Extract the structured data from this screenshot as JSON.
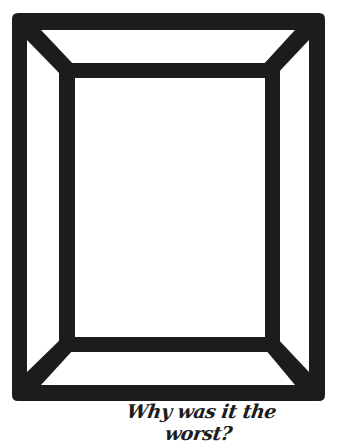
{
  "illustration": {
    "subject": "picture-frame-outline",
    "stroke_color": "#1c1c1c",
    "background_color": "#ffffff"
  },
  "caption": {
    "text": "Why was it the worst?"
  }
}
